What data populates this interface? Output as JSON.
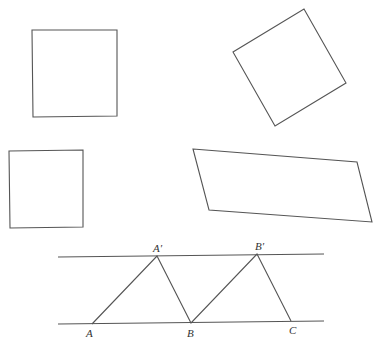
{
  "shapes": [
    {
      "name": "square-upright",
      "points": "32,30 117,30 117,116 33,117"
    },
    {
      "name": "square-rotated",
      "points": "304,9 346,83 275,126 233,52"
    },
    {
      "name": "rectangle-small",
      "points": "9,151 83,150 83,227 10,228"
    },
    {
      "name": "parallelogram",
      "points": "193,149 357,162 372,222 209,210"
    }
  ],
  "parallel_lines": [
    {
      "name": "upper-line",
      "x1": 58,
      "y1": 257,
      "x2": 324,
      "y2": 254
    },
    {
      "name": "lower-line",
      "x1": 58,
      "y1": 324,
      "x2": 324,
      "y2": 321
    }
  ],
  "zigzag": "92,324 157,256 191,323 257,254 291,321",
  "labels": {
    "A": "A",
    "A_prime": "A′",
    "B": "B",
    "B_prime": "B′",
    "C": "C"
  }
}
